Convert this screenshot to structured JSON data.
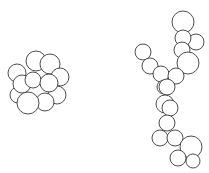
{
  "figure": {
    "width": 209,
    "height": 173,
    "stroke_color": "#3a3a3a",
    "fill_color": "#ffffff",
    "clusters": [
      {
        "name": "compact-cluster",
        "circles": [
          [
            36,
            61,
            10
          ],
          [
            50,
            64,
            10
          ],
          [
            17,
            73,
            9
          ],
          [
            60,
            77,
            9
          ],
          [
            18,
            95,
            8
          ],
          [
            22,
            84,
            9
          ],
          [
            57,
            95,
            9
          ],
          [
            33,
            80,
            8
          ],
          [
            49,
            83,
            9
          ],
          [
            45,
            102,
            9
          ],
          [
            28,
            103,
            11
          ]
        ]
      },
      {
        "name": "chain-cluster",
        "circles": [
          [
            183,
            22,
            11
          ],
          [
            196,
            42,
            8
          ],
          [
            183,
            38,
            8
          ],
          [
            182,
            50,
            8
          ],
          [
            188,
            63,
            11
          ],
          [
            143,
            52,
            8
          ],
          [
            150,
            66,
            8
          ],
          [
            161,
            74,
            8
          ],
          [
            176,
            76,
            8
          ],
          [
            164,
            87,
            7
          ],
          [
            167,
            87,
            8
          ],
          [
            165,
            104,
            9
          ],
          [
            170,
            108,
            8
          ],
          [
            167,
            123,
            8
          ],
          [
            160,
            138,
            8
          ],
          [
            175,
            138,
            8
          ],
          [
            191,
            147,
            11
          ],
          [
            193,
            161,
            7
          ],
          [
            178,
            158,
            8
          ]
        ]
      }
    ]
  }
}
